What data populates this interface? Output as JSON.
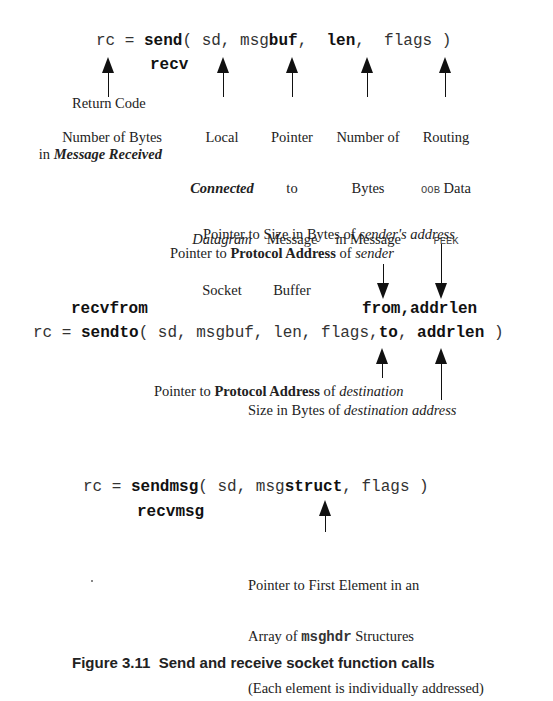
{
  "section1": {
    "call": {
      "prefix": "rc = ",
      "func": "send",
      "args_a": "( sd, msg",
      "buf": "buf",
      "comma1": ",  ",
      "len": "len",
      "comma2": ",  flags )"
    },
    "alt_func": "recv",
    "labels": {
      "return_code": "Return Code",
      "return_code_recv_1": "Number of Bytes",
      "return_code_recv_2_pre": "in ",
      "return_code_recv_2_em": "Message Received",
      "socket_1": "Local",
      "socket_2": "Connected",
      "socket_3": "Datagram",
      "socket_4": "Socket",
      "buf_1": "Pointer",
      "buf_2": "to",
      "buf_3": "Message",
      "buf_4": "Buffer",
      "len_1": "Number of",
      "len_2": "Bytes",
      "len_3": "in Message",
      "flags_1": "Routing",
      "flags_2_mono": "OOB",
      "flags_2_text": " Data",
      "flags_3": "PEEK"
    }
  },
  "section2": {
    "top_label_1_pre": "Pointer to Size in Bytes of ",
    "top_label_1_em": "sender's address",
    "top_label_2_pre": "Pointer to ",
    "top_label_2_bold": "Protocol Address",
    "top_label_2_mid": " of ",
    "top_label_2_em": "sender",
    "alt_func": "recvfrom",
    "alt_args": "from,addrlen",
    "call": {
      "prefix": "rc = ",
      "func": "sendto",
      "args": "( sd, msgbuf, len, flags,",
      "to": "to",
      "comma": ", ",
      "addrlen": "addrlen",
      "close": " )"
    },
    "bottom_label_1_pre": "Pointer to ",
    "bottom_label_1_bold": "Protocol Address",
    "bottom_label_1_mid": " of ",
    "bottom_label_1_em": "destination",
    "bottom_label_2_pre": "Size in Bytes of ",
    "bottom_label_2_em": "destination address"
  },
  "section3": {
    "call": {
      "prefix": "rc = ",
      "func": "sendmsg",
      "args_a": "( sd, msg",
      "struct": "struct",
      "args_b": ", flags )"
    },
    "alt_func": "recvmsg",
    "label_1": "Pointer to First Element in an",
    "label_2_pre": "Array of ",
    "label_2_mono": "msghdr",
    "label_2_post": " Structures",
    "label_3": "(Each element is individually addressed)"
  },
  "caption": {
    "text": "Figure 3.11  Send and receive socket function calls"
  }
}
